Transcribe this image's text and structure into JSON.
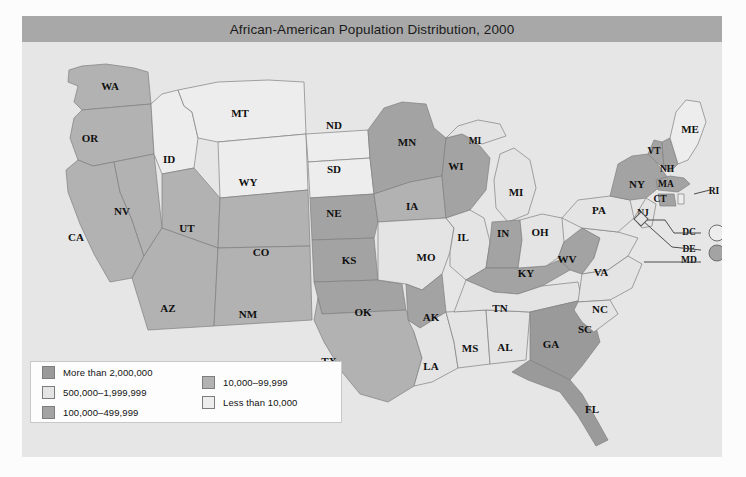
{
  "figure": {
    "title": "African-American Population Distribution, 2000"
  },
  "legend": {
    "column_1": [
      {
        "label": "More than 2,000,000",
        "color": "#9a9a9a"
      },
      {
        "label": "500,000–1,999,999",
        "color": "#e4e4e4"
      },
      {
        "label": "100,000–499,999",
        "color": "#a3a3a3"
      }
    ],
    "column_2": [
      {
        "label": "10,000–99,999",
        "color": "#b2b2b2"
      },
      {
        "label": "Less than 10,000",
        "color": "#ededed"
      }
    ]
  },
  "chart_data": {
    "type": "map",
    "title": "African-American Population Distribution, 2000",
    "year": 2000,
    "classes": [
      {
        "id": "c1",
        "label": "More than 2,000,000",
        "color": "#9a9a9a"
      },
      {
        "id": "c2",
        "label": "500,000–1,999,999",
        "color": "#e4e4e4"
      },
      {
        "id": "c3",
        "label": "100,000–499,999",
        "color": "#a3a3a3"
      },
      {
        "id": "c4",
        "label": "10,000–99,999",
        "color": "#b2b2b2"
      },
      {
        "id": "c5",
        "label": "Less than 10,000",
        "color": "#ededed"
      }
    ],
    "states": [
      {
        "code": "WA",
        "class": "c4"
      },
      {
        "code": "OR",
        "class": "c4"
      },
      {
        "code": "CA",
        "class": "c4"
      },
      {
        "code": "NV",
        "class": "c4"
      },
      {
        "code": "ID",
        "class": "c5"
      },
      {
        "code": "MT",
        "class": "c5"
      },
      {
        "code": "WY",
        "class": "c5"
      },
      {
        "code": "UT",
        "class": "c4"
      },
      {
        "code": "AZ",
        "class": "c4"
      },
      {
        "code": "CO",
        "class": "c4"
      },
      {
        "code": "NM",
        "class": "c4"
      },
      {
        "code": "ND",
        "class": "c5"
      },
      {
        "code": "SD",
        "class": "c5"
      },
      {
        "code": "NE",
        "class": "c3"
      },
      {
        "code": "KS",
        "class": "c3"
      },
      {
        "code": "OK",
        "class": "c3"
      },
      {
        "code": "TX",
        "class": "c4"
      },
      {
        "code": "MN",
        "class": "c3"
      },
      {
        "code": "IA",
        "class": "c4"
      },
      {
        "code": "MO",
        "class": "c2"
      },
      {
        "code": "AK",
        "class": "c3"
      },
      {
        "code": "LA",
        "class": "c2"
      },
      {
        "code": "WI",
        "class": "c3"
      },
      {
        "code": "IL",
        "class": "c2"
      },
      {
        "code": "MS",
        "class": "c2"
      },
      {
        "code": "AL",
        "class": "c2"
      },
      {
        "code": "MI",
        "class": "c2"
      },
      {
        "code": "IN",
        "class": "c3"
      },
      {
        "code": "KY",
        "class": "c3"
      },
      {
        "code": "TN",
        "class": "c2"
      },
      {
        "code": "GA",
        "class": "c1"
      },
      {
        "code": "FL",
        "class": "c1"
      },
      {
        "code": "OH",
        "class": "c2"
      },
      {
        "code": "WV",
        "class": "c3"
      },
      {
        "code": "VA",
        "class": "c2"
      },
      {
        "code": "NC",
        "class": "c2"
      },
      {
        "code": "SC",
        "class": "c2"
      },
      {
        "code": "PA",
        "class": "c2"
      },
      {
        "code": "NY",
        "class": "c3"
      },
      {
        "code": "NJ",
        "class": "c2"
      },
      {
        "code": "VT",
        "class": "c3"
      },
      {
        "code": "NH",
        "class": "c3"
      },
      {
        "code": "MA",
        "class": "c3"
      },
      {
        "code": "CT",
        "class": "c3"
      },
      {
        "code": "RI",
        "class": "c5"
      },
      {
        "code": "ME",
        "class": "c5"
      },
      {
        "code": "DC",
        "class": "c5"
      },
      {
        "code": "DE",
        "class": "c3"
      },
      {
        "code": "MD",
        "class": "c3"
      }
    ],
    "labels": [
      {
        "code": "WA",
        "x": 88,
        "y": 45
      },
      {
        "code": "OR",
        "x": 68,
        "y": 97
      },
      {
        "code": "CA",
        "x": 54,
        "y": 196
      },
      {
        "code": "NV",
        "x": 100,
        "y": 170
      },
      {
        "code": "ID",
        "x": 147,
        "y": 118
      },
      {
        "code": "MT",
        "x": 218,
        "y": 72
      },
      {
        "code": "WY",
        "x": 226,
        "y": 141
      },
      {
        "code": "UT",
        "x": 165,
        "y": 187
      },
      {
        "code": "AZ",
        "x": 146,
        "y": 267
      },
      {
        "code": "CO",
        "x": 239,
        "y": 211
      },
      {
        "code": "NM",
        "x": 226,
        "y": 273
      },
      {
        "code": "ND",
        "x": 312,
        "y": 84
      },
      {
        "code": "SD",
        "x": 312,
        "y": 128
      },
      {
        "code": "NE",
        "x": 312,
        "y": 172
      },
      {
        "code": "KS",
        "x": 327,
        "y": 219
      },
      {
        "code": "OK",
        "x": 341,
        "y": 271
      },
      {
        "code": "TX",
        "x": 307,
        "y": 320
      },
      {
        "code": "MN",
        "x": 385,
        "y": 101
      },
      {
        "code": "IA",
        "x": 390,
        "y": 165
      },
      {
        "code": "MO",
        "x": 404,
        "y": 216
      },
      {
        "code": "AK",
        "x": 409,
        "y": 276
      },
      {
        "code": "LA",
        "x": 409,
        "y": 325
      },
      {
        "code": "WI",
        "x": 434,
        "y": 125
      },
      {
        "code": "IL",
        "x": 441,
        "y": 196
      },
      {
        "code": "MS",
        "x": 448,
        "y": 307
      },
      {
        "code": "AL",
        "x": 483,
        "y": 306
      },
      {
        "code": "MI-up",
        "x": 453,
        "y": 100,
        "text": "MI"
      },
      {
        "code": "MI",
        "x": 494,
        "y": 151
      },
      {
        "code": "IN",
        "x": 481,
        "y": 192
      },
      {
        "code": "KY",
        "x": 504,
        "y": 232
      },
      {
        "code": "TN",
        "x": 478,
        "y": 267
      },
      {
        "code": "GA",
        "x": 529,
        "y": 303
      },
      {
        "code": "FL",
        "x": 570,
        "y": 368
      },
      {
        "code": "OH",
        "x": 518,
        "y": 191
      },
      {
        "code": "WV",
        "x": 545,
        "y": 218
      },
      {
        "code": "VA",
        "x": 579,
        "y": 231
      },
      {
        "code": "NC",
        "x": 578,
        "y": 268
      },
      {
        "code": "SC",
        "x": 563,
        "y": 288
      },
      {
        "code": "PA",
        "x": 577,
        "y": 169
      },
      {
        "code": "NY",
        "x": 615,
        "y": 143
      },
      {
        "code": "NJ",
        "x": 621,
        "y": 172
      },
      {
        "code": "VT",
        "x": 632,
        "y": 110
      },
      {
        "code": "NH",
        "x": 645,
        "y": 128
      },
      {
        "code": "MA",
        "x": 644,
        "y": 143
      },
      {
        "code": "CT",
        "x": 638,
        "y": 158
      },
      {
        "code": "RI",
        "x": 692,
        "y": 150
      },
      {
        "code": "ME",
        "x": 668,
        "y": 88
      },
      {
        "code": "DC",
        "x": 667,
        "y": 191
      },
      {
        "code": "DE",
        "x": 667,
        "y": 208
      },
      {
        "code": "MD",
        "x": 667,
        "y": 219
      }
    ],
    "inset_markers": [
      {
        "code": "DC",
        "class": "c5",
        "cx": 695,
        "cy": 191
      },
      {
        "code": "DE-MD",
        "class": "c3",
        "cx": 695,
        "cy": 211
      }
    ]
  }
}
